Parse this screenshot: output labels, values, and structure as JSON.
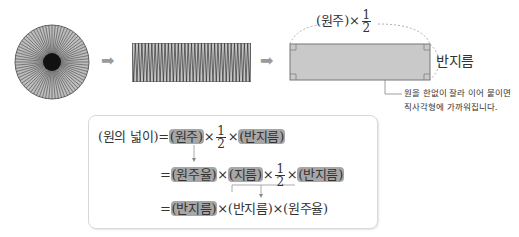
{
  "figure": {
    "circle": {
      "label": "circle-cut-into-sectors",
      "sectors": 72
    },
    "strip": {
      "label": "sectors-rearranged-strip"
    },
    "rectangle": {
      "top_label_prefix": "(원주)×",
      "top_label_num": "1",
      "top_label_den": "2",
      "side_label": "반지름",
      "note_line1": "원을 한없이 잘라 이어 붙이면",
      "note_line2": "직사각형에 가까워집니다."
    },
    "arrows": [
      "➡",
      "➡"
    ]
  },
  "formula": {
    "line1": {
      "lhs": "(원의 넓이)",
      "eq": "=",
      "t1": "(원주)",
      "x1": "×",
      "num": "1",
      "den": "2",
      "x2": "×",
      "t2": "(반지름)"
    },
    "line2": {
      "eq": "=",
      "t1": "(원주율)",
      "x1": "×",
      "t2": "(지름)",
      "x2": "×",
      "num": "1",
      "den": "2",
      "x3": "×",
      "t3": "(반지름)"
    },
    "line3": {
      "eq": "=",
      "t1": "(반지름)",
      "x1": "×",
      "t2": "(반지름)",
      "x2": "×",
      "t3": "(원주율)"
    }
  },
  "colors": {
    "highlight": "#a7a7a7",
    "arrow": "#9a9a9a",
    "rect_fill": "#c9c9c9"
  }
}
